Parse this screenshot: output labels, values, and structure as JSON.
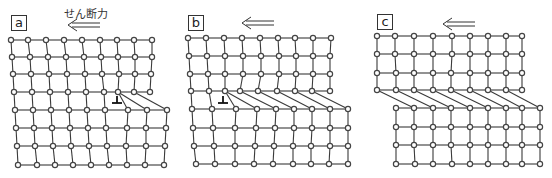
{
  "figure": {
    "force_label": "せん断力",
    "panels": [
      {
        "id": "a",
        "label": "a",
        "label_pos": [
          11,
          15
        ],
        "arrow": {
          "x1": 100,
          "x2": 68,
          "y": 25
        },
        "dislocation": {
          "x": 117,
          "y": 100
        },
        "rows": [
          {
            "y": 40,
            "xs": [
              11,
              28,
              46,
              64,
              82,
              100,
              117,
              134,
              152
            ]
          },
          {
            "y": 57,
            "xs": [
              12,
              30,
              48,
              66,
              84,
              101,
              118,
              135,
              152
            ]
          },
          {
            "y": 74,
            "xs": [
              13,
              31,
              49,
              67,
              85,
              102,
              119,
              135,
              151
            ]
          },
          {
            "y": 92,
            "xs": [
              14,
              32,
              50,
              68,
              86,
              104,
              118,
              134,
              150
            ]
          },
          {
            "y": 110,
            "xs": [
              15,
              33,
              51,
              69,
              87,
              105,
              128,
              147,
              167
            ]
          },
          {
            "y": 128,
            "xs": [
              16,
              34,
              52,
              70,
              88,
              106,
              127,
              146,
              166
            ]
          },
          {
            "y": 146,
            "xs": [
              17,
              35,
              53,
              71,
              89,
              107,
              126,
              146,
              165
            ]
          },
          {
            "y": 165,
            "xs": [
              18,
              37,
              55,
              73,
              91,
              109,
              127,
              145,
              164
            ]
          }
        ],
        "vertical_links": [
          [
            0,
            0
          ],
          [
            1,
            1
          ],
          [
            2,
            2
          ],
          [
            3,
            3
          ],
          [
            4,
            4
          ],
          [
            5,
            5
          ],
          [
            6,
            6
          ],
          [
            7,
            6
          ],
          [
            8,
            7
          ]
        ]
      },
      {
        "id": "b",
        "label": "b",
        "label_pos": [
          188,
          15
        ],
        "arrow": {
          "x1": 274,
          "x2": 242,
          "y": 23
        },
        "dislocation": {
          "x": 223,
          "y": 100
        },
        "rows": [
          {
            "y": 38,
            "xs": [
              188,
              206,
              224,
              242,
              260,
              278,
              295,
              313,
              331
            ]
          },
          {
            "y": 56,
            "xs": [
              189,
              207,
              225,
              243,
              261,
              279,
              296,
              313,
              330
            ]
          },
          {
            "y": 74,
            "xs": [
              190,
              208,
              225,
              243,
              261,
              279,
              296,
              313,
              330
            ]
          },
          {
            "y": 91,
            "xs": [
              191,
              209,
              225,
              240,
              258,
              277,
              295,
              312,
              330
            ]
          },
          {
            "y": 109,
            "xs": [
              192,
              212,
              236,
              257,
              276,
              294,
              312,
              330,
              348
            ]
          },
          {
            "y": 128,
            "xs": [
              193,
              213,
              235,
              256,
              275,
              294,
              312,
              330,
              348
            ]
          },
          {
            "y": 146,
            "xs": [
              194,
              214,
              235,
              255,
              274,
              293,
              311,
              330,
              348
            ]
          },
          {
            "y": 164,
            "xs": [
              196,
              215,
              235,
              254,
              273,
              293,
              311,
              329,
              348
            ]
          }
        ],
        "vertical_links": [
          [
            0,
            0
          ],
          [
            1,
            1
          ],
          [
            2,
            2
          ],
          [
            3,
            2
          ],
          [
            4,
            3
          ],
          [
            5,
            4
          ],
          [
            6,
            5
          ],
          [
            7,
            6
          ],
          [
            8,
            7
          ]
        ]
      },
      {
        "id": "c",
        "label": "c",
        "label_pos": [
          377,
          14
        ],
        "arrow": {
          "x1": 475,
          "x2": 443,
          "y": 24
        },
        "dislocation": null,
        "rows": [
          {
            "y": 36,
            "xs": [
              377,
              395,
              414,
              433,
              452,
              470,
              488,
              506,
              522
            ]
          },
          {
            "y": 54,
            "xs": [
              377,
              395,
              414,
              433,
              452,
              470,
              488,
              506,
              522
            ]
          },
          {
            "y": 73,
            "xs": [
              377,
              396,
              414,
              433,
              451,
              470,
              488,
              506,
              522
            ]
          },
          {
            "y": 90,
            "xs": [
              377,
              396,
              414,
              433,
              451,
              470,
              488,
              506,
              522
            ]
          },
          {
            "y": 108,
            "xs": [
              396,
              414,
              433,
              451,
              470,
              488,
              506,
              522,
              540
            ]
          },
          {
            "y": 127,
            "xs": [
              396,
              414,
              433,
              451,
              470,
              488,
              506,
              522,
              540
            ]
          },
          {
            "y": 145,
            "xs": [
              396,
              414,
              433,
              451,
              470,
              488,
              506,
              522,
              540
            ]
          },
          {
            "y": 164,
            "xs": [
              396,
              415,
              433,
              452,
              470,
              488,
              506,
              522,
              540
            ]
          }
        ],
        "vertical_links": [
          [
            1,
            0
          ],
          [
            2,
            1
          ],
          [
            3,
            2
          ],
          [
            4,
            3
          ],
          [
            5,
            4
          ],
          [
            6,
            5
          ],
          [
            7,
            6
          ],
          [
            8,
            7
          ]
        ]
      }
    ],
    "style": {
      "line_color": "#3a3a3a",
      "node_stroke": "#444444",
      "node_fill": "#ffffff",
      "node_radius": 2.6
    }
  }
}
